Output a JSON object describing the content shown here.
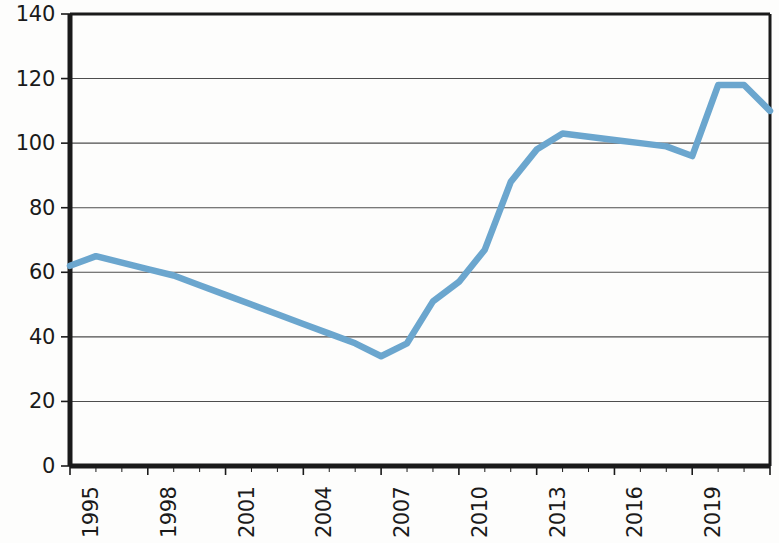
{
  "chart_data": {
    "type": "line",
    "title": "",
    "subtitle": "",
    "xlabel": "",
    "ylabel": "",
    "x": [
      1995,
      1996,
      1997,
      1998,
      1999,
      2000,
      2001,
      2002,
      2003,
      2004,
      2005,
      2006,
      2007,
      2008,
      2009,
      2010,
      2011,
      2012,
      2013,
      2014,
      2015,
      2016,
      2017,
      2018,
      2019,
      2020,
      2021,
      2022
    ],
    "categories": [
      "1995",
      "1996",
      "1997",
      "1998",
      "1999",
      "2000",
      "2001",
      "2002",
      "2003",
      "2004",
      "2005",
      "2006",
      "2007",
      "2008",
      "2009",
      "2010",
      "2011",
      "2012",
      "2013",
      "2014",
      "2015",
      "2016",
      "2017",
      "2018",
      "2019",
      "2020",
      "2021",
      "2022"
    ],
    "values": [
      62,
      65,
      63,
      61,
      59,
      56,
      53,
      50,
      47,
      44,
      41,
      38,
      34,
      38,
      51,
      57,
      67,
      88,
      98,
      103,
      102,
      101,
      100,
      99,
      96,
      118,
      118,
      110
    ],
    "series": [
      {
        "name": "series-1",
        "color": "#6ba6ce",
        "values": [
          62,
          65,
          63,
          61,
          59,
          56,
          53,
          50,
          47,
          44,
          41,
          38,
          34,
          38,
          51,
          57,
          67,
          88,
          98,
          103,
          102,
          101,
          100,
          99,
          96,
          118,
          118,
          110
        ]
      }
    ],
    "ylim": [
      0,
      140
    ],
    "xlim": [
      1995,
      2022
    ],
    "yticks": [
      0,
      20,
      40,
      60,
      80,
      100,
      120,
      140
    ],
    "ytick_labels": [
      "0",
      "20",
      "40",
      "60",
      "80",
      "100",
      "120",
      "140"
    ],
    "xticks": [
      1995,
      1998,
      2001,
      2004,
      2007,
      2010,
      2013,
      2016,
      2019,
      2022
    ],
    "xtick_labels": [
      "1995",
      "1998",
      "2001",
      "2004",
      "2007",
      "2010",
      "2013",
      "2016",
      "2019",
      "2022"
    ],
    "grid": "horizontal",
    "grid_color": "#4d4d4d",
    "legend": "none",
    "xtick_rotation": 90,
    "axis_color": "#1a1a1a",
    "background": "#ffffff"
  }
}
